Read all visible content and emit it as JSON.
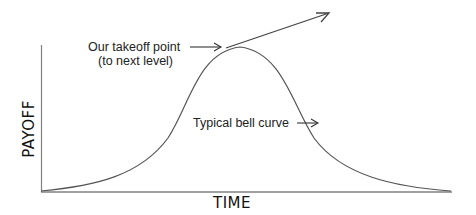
{
  "diagram": {
    "type": "bell-curve-concept",
    "axes": {
      "x_label": "TIME",
      "y_label": "PAYOFF"
    },
    "annotations": {
      "takeoff_line1": "Our takeoff point",
      "takeoff_line2": "(to next level)",
      "bell_curve": "Typical bell curve"
    },
    "colors": {
      "line": "#555555",
      "axis": "#777777",
      "text": "#222222"
    }
  }
}
